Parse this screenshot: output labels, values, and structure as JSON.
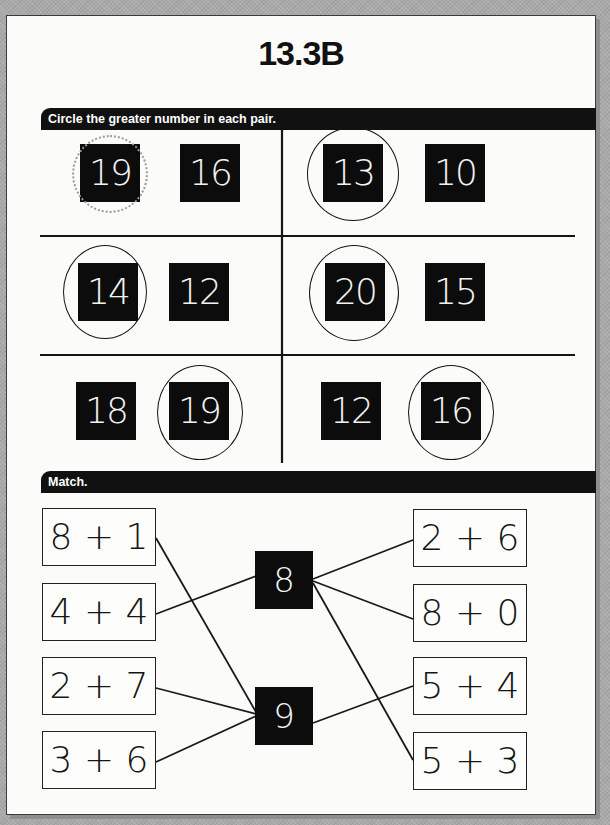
{
  "worksheet": {
    "title": "13.3B",
    "colors": {
      "ink": "#111111",
      "paper": "#fbfbfa",
      "tile": "#0c0c0c",
      "tile_text": "#f2f2f2",
      "example_circle": "#9a9a9a",
      "background": "#a9a9a9"
    }
  },
  "circle_section": {
    "instruction": "Circle the greater number in each pair.",
    "pairs": [
      {
        "row": 1,
        "col": 1,
        "numbers": [
          "19",
          "16"
        ],
        "circled": "19",
        "circle_style": "dotted-example"
      },
      {
        "row": 1,
        "col": 2,
        "numbers": [
          "13",
          "10"
        ],
        "circled": "13",
        "circle_style": "solid"
      },
      {
        "row": 2,
        "col": 1,
        "numbers": [
          "14",
          "12"
        ],
        "circled": "14",
        "circle_style": "solid"
      },
      {
        "row": 2,
        "col": 2,
        "numbers": [
          "20",
          "15"
        ],
        "circled": "20",
        "circle_style": "solid"
      },
      {
        "row": 3,
        "col": 1,
        "numbers": [
          "18",
          "19"
        ],
        "circled": "19",
        "circle_style": "solid"
      },
      {
        "row": 3,
        "col": 2,
        "numbers": [
          "12",
          "16"
        ],
        "circled": "16",
        "circle_style": "solid"
      }
    ]
  },
  "match_section": {
    "instruction": "Match.",
    "left_expressions": [
      "8 + 1",
      "4 + 4",
      "2 + 7",
      "3 + 6"
    ],
    "center_values": [
      "8",
      "9"
    ],
    "right_expressions": [
      "2 + 6",
      "8 + 0",
      "5 + 4",
      "5 + 3"
    ],
    "connections": [
      {
        "from": "8 + 1",
        "to": "9"
      },
      {
        "from": "4 + 4",
        "to": "8"
      },
      {
        "from": "2 + 7",
        "to": "9"
      },
      {
        "from": "3 + 6",
        "to": "9"
      },
      {
        "from": "8",
        "to": "2 + 6"
      },
      {
        "from": "8",
        "to": "8 + 0"
      },
      {
        "from": "8",
        "to": "5 + 3"
      },
      {
        "from": "9",
        "to": "5 + 4"
      }
    ]
  }
}
